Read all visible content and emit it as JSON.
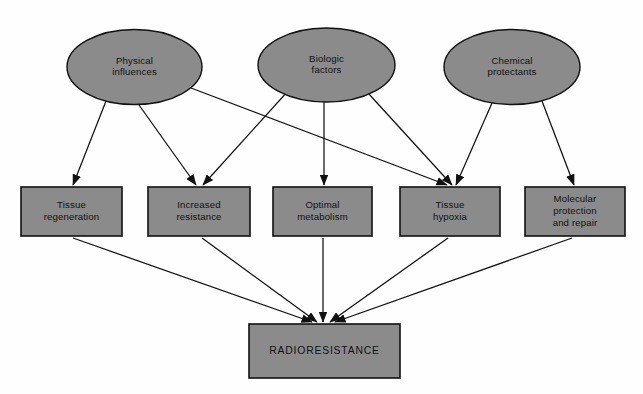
{
  "diagram": {
    "background_color": "#fefefe",
    "shape_fill_color": "#8b8b8b",
    "shape_stroke_color": "#111111",
    "text_color": "#101010",
    "sources": [
      {
        "id": "physical-influences",
        "label_line1": "Physical",
        "label_line2": "influences",
        "shape": "ellipse",
        "cx": 134.5,
        "cy": 67,
        "rx": 67.5,
        "ry": 37.5
      },
      {
        "id": "biologic-factors",
        "label_line1": "Biologic",
        "label_line2": "factors",
        "shape": "ellipse",
        "cx": 326.5,
        "cy": 65,
        "rx": 68.5,
        "ry": 37
      },
      {
        "id": "chemical-protectants",
        "label_line1": "Chemical",
        "label_line2": "protectants",
        "shape": "ellipse",
        "cx": 512,
        "cy": 67,
        "rx": 68,
        "ry": 37.5
      }
    ],
    "mechanisms": [
      {
        "id": "tissue-regeneration",
        "label_line1": "Tissue",
        "label_line2": "regeneration",
        "label_line3": "",
        "shape": "rect",
        "x": 21,
        "y": 187,
        "w": 101,
        "h": 49
      },
      {
        "id": "increased-resistance",
        "label_line1": "Increased",
        "label_line2": "resistance",
        "label_line3": "",
        "shape": "rect",
        "x": 148,
        "y": 187,
        "w": 102,
        "h": 49
      },
      {
        "id": "optimal-metabolism",
        "label_line1": "Optimal",
        "label_line2": "metabolism",
        "label_line3": "",
        "shape": "rect",
        "x": 273,
        "y": 187,
        "w": 99,
        "h": 49
      },
      {
        "id": "tissue-hypoxia",
        "label_line1": "Tissue",
        "label_line2": "hypoxia",
        "label_line3": "",
        "shape": "rect",
        "x": 400,
        "y": 187,
        "w": 100,
        "h": 49
      },
      {
        "id": "molecular-protection",
        "label_line1": "Molecular",
        "label_line2": "protection",
        "label_line3": "and repair",
        "shape": "rect",
        "x": 525,
        "y": 187,
        "w": 100,
        "h": 49
      }
    ],
    "outcome": {
      "id": "radioresistance",
      "label": "RADIORESISTANCE",
      "shape": "rect",
      "x": 249,
      "y": 324,
      "w": 151,
      "h": 54
    },
    "edges": [
      {
        "id": "physical-to-tissue-regeneration",
        "from": "physical-influences",
        "to": "tissue-regeneration",
        "x1": 106,
        "y1": 101,
        "x2": 73,
        "y2": 185
      },
      {
        "id": "physical-to-increased-resistance",
        "from": "physical-influences",
        "to": "increased-resistance",
        "x1": 139,
        "y1": 105,
        "x2": 196,
        "y2": 185
      },
      {
        "id": "physical-to-tissue-hypoxia",
        "from": "physical-influences",
        "to": "tissue-hypoxia",
        "x1": 191,
        "y1": 88,
        "x2": 447,
        "y2": 185
      },
      {
        "id": "biologic-to-increased-resistance",
        "from": "biologic-factors",
        "to": "increased-resistance",
        "x1": 288,
        "y1": 91,
        "x2": 203,
        "y2": 185
      },
      {
        "id": "biologic-to-optimal-metabolism",
        "from": "biologic-factors",
        "to": "optimal-metabolism",
        "x1": 324,
        "y1": 102,
        "x2": 324,
        "y2": 185
      },
      {
        "id": "biologic-to-tissue-hypoxia",
        "from": "biologic-factors",
        "to": "tissue-hypoxia",
        "x1": 368,
        "y1": 93,
        "x2": 452,
        "y2": 185
      },
      {
        "id": "chemical-to-tissue-hypoxia",
        "from": "chemical-protectants",
        "to": "tissue-hypoxia",
        "x1": 492,
        "y1": 103,
        "x2": 456,
        "y2": 185
      },
      {
        "id": "chemical-to-molecular-protection",
        "from": "chemical-protectants",
        "to": "molecular-protection",
        "x1": 542,
        "y1": 101,
        "x2": 574,
        "y2": 185
      },
      {
        "id": "tissue-regeneration-to-radioresistance",
        "from": "tissue-regeneration",
        "to": "radioresistance",
        "x1": 73,
        "y1": 238,
        "x2": 312,
        "y2": 322
      },
      {
        "id": "increased-resistance-to-radioresistance",
        "from": "increased-resistance",
        "to": "radioresistance",
        "x1": 202,
        "y1": 238,
        "x2": 317,
        "y2": 322
      },
      {
        "id": "optimal-metabolism-to-radioresistance",
        "from": "optimal-metabolism",
        "to": "radioresistance",
        "x1": 323,
        "y1": 238,
        "x2": 323,
        "y2": 322
      },
      {
        "id": "tissue-hypoxia-to-radioresistance",
        "from": "tissue-hypoxia",
        "to": "radioresistance",
        "x1": 448,
        "y1": 238,
        "x2": 330,
        "y2": 322
      },
      {
        "id": "molecular-protection-to-radioresistance",
        "from": "molecular-protection",
        "to": "radioresistance",
        "x1": 572,
        "y1": 238,
        "x2": 335,
        "y2": 322
      }
    ]
  }
}
